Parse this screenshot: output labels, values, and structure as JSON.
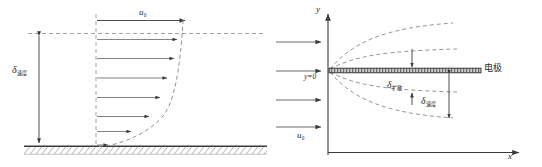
{
  "figure": {
    "kind": "two-panel-schematic"
  },
  "left_panel": {
    "name": "velocity-boundary-layer-over-plate",
    "freestream_label": "u",
    "freestream_sub": "0",
    "thickness_label": "δ",
    "thickness_sub": "速度",
    "arrow_count": 7,
    "wall": "hatched-ground",
    "profile_curve": "parabolic-dashed",
    "colors": {
      "line": "#3a3a3a",
      "dashed": "#777777",
      "text": "#2a2a2a",
      "hatch": "#555555"
    }
  },
  "right_panel": {
    "name": "electrode-diffusion-and-velocity-layers",
    "axis_y_label": "y",
    "axis_x_label": "x",
    "origin_label": "y=0",
    "electrode_label": "电极",
    "inflow_label": "u",
    "inflow_sub": "0",
    "inflow_arrow_count": 4,
    "diffusion_layer_label": "δ",
    "diffusion_layer_sub": "扩散",
    "velocity_layer_label": "δ",
    "velocity_layer_sub": "速度",
    "boundary_curves": 4,
    "colors": {
      "axis": "#3a3a3a",
      "dashed": "#888888",
      "electrode_fill": "#c9c9c9",
      "text": "#2a2a2a"
    }
  }
}
